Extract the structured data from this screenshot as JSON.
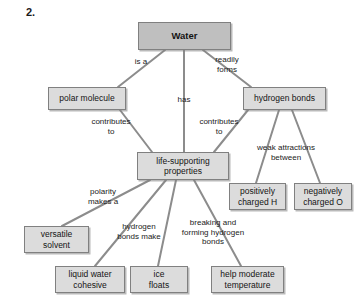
{
  "question_number": "2.",
  "diagram": {
    "type": "concept-map",
    "colors": {
      "root_fill": "#bfbfbf",
      "node_fill": "#dcdcdc",
      "node_border": "#808080",
      "edge_line": "#8c8c8c",
      "text": "#141414",
      "background": "#ffffff"
    },
    "nodes": [
      {
        "id": "water",
        "label": "Water",
        "x": 138,
        "y": 22,
        "w": 93,
        "h": 28,
        "root": true
      },
      {
        "id": "polar_molecule",
        "label": "polar molecule",
        "x": 48,
        "y": 87,
        "w": 78,
        "h": 23,
        "root": false
      },
      {
        "id": "hydrogen_bonds",
        "label": "hydrogen bonds",
        "x": 243,
        "y": 87,
        "w": 83,
        "h": 23,
        "root": false
      },
      {
        "id": "life_supporting",
        "label": "life-supporting\nproperties",
        "x": 137,
        "y": 152,
        "w": 92,
        "h": 28,
        "root": false
      },
      {
        "id": "positive_h",
        "label": "positively\ncharged H",
        "x": 229,
        "y": 183,
        "w": 57,
        "h": 27,
        "root": false
      },
      {
        "id": "negative_o",
        "label": "negatively\ncharged O",
        "x": 294,
        "y": 183,
        "w": 58,
        "h": 27,
        "root": false
      },
      {
        "id": "versatile_solvent",
        "label": "versatile\nsolvent",
        "x": 24,
        "y": 226,
        "w": 65,
        "h": 27,
        "root": false
      },
      {
        "id": "liquid_cohesive",
        "label": "liquid water\ncohesive",
        "x": 55,
        "y": 266,
        "w": 70,
        "h": 27,
        "root": false
      },
      {
        "id": "ice_floats",
        "label": "ice\nfloats",
        "x": 130,
        "y": 266,
        "w": 58,
        "h": 27,
        "root": false
      },
      {
        "id": "moderate_temp",
        "label": "help moderate\ntemperature",
        "x": 211,
        "y": 266,
        "w": 73,
        "h": 27,
        "root": false
      }
    ],
    "edges": [
      {
        "id": "water-polar",
        "from": "water",
        "to": "polar_molecule",
        "x1": 165,
        "y1": 50,
        "x2": 118,
        "y2": 87
      },
      {
        "id": "water-life",
        "from": "water",
        "to": "life_supporting",
        "x1": 184,
        "y1": 50,
        "x2": 184,
        "y2": 152
      },
      {
        "id": "water-hbonds",
        "from": "water",
        "to": "hydrogen_bonds",
        "x1": 203,
        "y1": 50,
        "x2": 251,
        "y2": 87
      },
      {
        "id": "polar-life",
        "from": "polar_molecule",
        "to": "life_supporting",
        "x1": 120,
        "y1": 110,
        "x2": 152,
        "y2": 152
      },
      {
        "id": "hbonds-life",
        "from": "hydrogen_bonds",
        "to": "life_supporting",
        "x1": 248,
        "y1": 110,
        "x2": 214,
        "y2": 152
      },
      {
        "id": "hbonds-positive",
        "from": "hydrogen_bonds",
        "to": "positive_h",
        "x1": 279,
        "y1": 110,
        "x2": 256,
        "y2": 183
      },
      {
        "id": "hbonds-negative",
        "from": "hydrogen_bonds",
        "to": "negative_o",
        "x1": 292,
        "y1": 110,
        "x2": 320,
        "y2": 183
      },
      {
        "id": "life-solvent",
        "from": "life_supporting",
        "to": "versatile_solvent",
        "x1": 150,
        "y1": 180,
        "x2": 62,
        "y2": 226
      },
      {
        "id": "life-cohesive",
        "from": "life_supporting",
        "to": "liquid_cohesive",
        "x1": 166,
        "y1": 180,
        "x2": 95,
        "y2": 266
      },
      {
        "id": "life-ice",
        "from": "life_supporting",
        "to": "ice_floats",
        "x1": 176,
        "y1": 180,
        "x2": 158,
        "y2": 266
      },
      {
        "id": "life-temp",
        "from": "life_supporting",
        "to": "moderate_temp",
        "x1": 194,
        "y1": 180,
        "x2": 241,
        "y2": 266
      }
    ],
    "edge_labels": [
      {
        "id": "is-a",
        "text": "is a",
        "x": 126,
        "y": 57,
        "w": 30
      },
      {
        "id": "has",
        "text": "has",
        "x": 168,
        "y": 95,
        "w": 32
      },
      {
        "id": "readily-forms",
        "text": "readily\nforms",
        "x": 207,
        "y": 55,
        "w": 40
      },
      {
        "id": "contributes-to-left",
        "text": "contributes\nto",
        "x": 85,
        "y": 117,
        "w": 52
      },
      {
        "id": "contributes-to-right",
        "text": "contributes\nto",
        "x": 193,
        "y": 117,
        "w": 52
      },
      {
        "id": "weak-attractions",
        "text": "weak attractions\nbetween",
        "x": 250,
        "y": 143,
        "w": 72
      },
      {
        "id": "polarity-makes-a",
        "text": "polarity\nmakes a",
        "x": 82,
        "y": 187,
        "w": 42
      },
      {
        "id": "hydrogen-bonds-make",
        "text": "hydrogen\nbonds make",
        "x": 112,
        "y": 222,
        "w": 54
      },
      {
        "id": "breaking-forming",
        "text": "breaking and\nforming hydrogen\nbonds",
        "x": 175,
        "y": 218,
        "w": 76
      }
    ]
  }
}
